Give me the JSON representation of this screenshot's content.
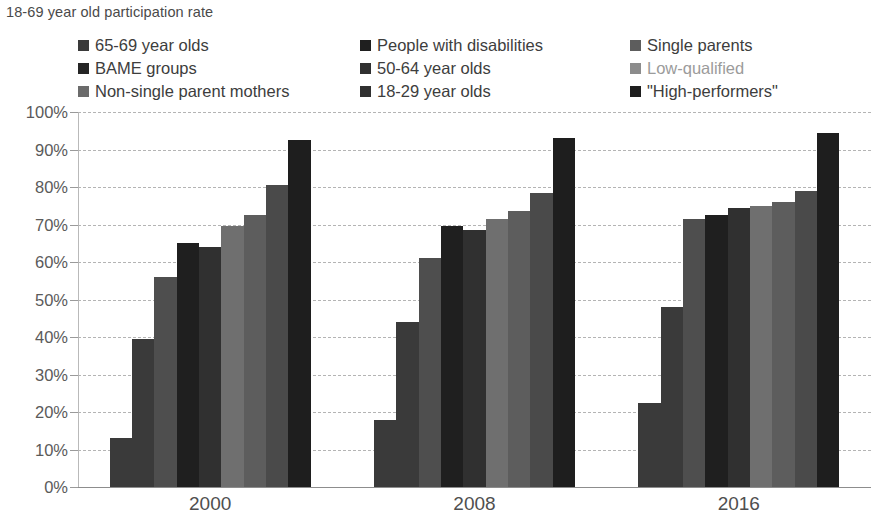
{
  "chart_data": {
    "type": "bar",
    "title": "18-69 year old participation rate",
    "xlabel": "",
    "ylabel": "",
    "ylim": [
      0,
      100
    ],
    "ytick_labels": [
      "100%",
      "90%",
      "80%",
      "70%",
      "60%",
      "50%",
      "40%",
      "30%",
      "20%",
      "10%",
      "0%"
    ],
    "ytick_values": [
      100,
      90,
      80,
      70,
      60,
      50,
      40,
      30,
      20,
      10,
      0
    ],
    "grid": true,
    "legend_position": "top",
    "categories": [
      "2000",
      "2008",
      "2016"
    ],
    "series": [
      {
        "name": "65-69 year olds",
        "color": "#3a3a3a",
        "values": [
          13.0,
          18.0,
          22.5
        ]
      },
      {
        "name": "BAME groups",
        "color": "#3a3a3a",
        "values": [
          39.5,
          44.0,
          48.0
        ]
      },
      {
        "name": "Non-single parent mothers",
        "color": "#4e4e4e",
        "values": [
          56.0,
          61.0,
          71.5
        ]
      },
      {
        "name": "People with disabilities",
        "color": "#1f1f1f",
        "values": [
          65.0,
          69.5,
          72.5
        ]
      },
      {
        "name": "50-64 year olds",
        "color": "#303030",
        "values": [
          64.0,
          68.5,
          74.5
        ]
      },
      {
        "name": "18-29 year olds",
        "color": "#6f6f6f",
        "values": [
          69.5,
          71.5,
          75.0
        ]
      },
      {
        "name": "Single parents",
        "color": "#5d5d5d",
        "values": [
          72.5,
          73.5,
          76.0
        ]
      },
      {
        "name": "Low-qualified",
        "color": "#4a4a4a",
        "values": [
          80.5,
          78.5,
          79.0
        ]
      },
      {
        "name": "\"High-performers\"",
        "color": "#1e1e1e",
        "values": [
          92.5,
          93.0,
          94.5
        ]
      }
    ]
  },
  "legend": {
    "items": [
      {
        "label": "65-69 year olds",
        "color": "#3a3a3a",
        "text_style": "normal"
      },
      {
        "label": "People with disabilities",
        "color": "#1f1f1f",
        "text_style": "normal"
      },
      {
        "label": "Single parents",
        "color": "#5d5d5d",
        "text_style": "normal"
      },
      {
        "label": "BAME groups",
        "color": "#252525",
        "text_style": "normal"
      },
      {
        "label": "50-64 year olds",
        "color": "#303030",
        "text_style": "normal"
      },
      {
        "label": "Low-qualified",
        "color": "#8c8c8c",
        "text_style": "light"
      },
      {
        "label": "Non-single parent mothers",
        "color": "#6b6b6b",
        "text_style": "normal"
      },
      {
        "label": "18-29 year olds",
        "color": "#303030",
        "text_style": "normal"
      },
      {
        "label": "\"High-performers\"",
        "color": "#1e1e1e",
        "text_style": "normal"
      }
    ]
  }
}
